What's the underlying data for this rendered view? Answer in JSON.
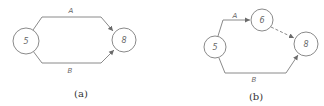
{
  "diagrams": [
    {
      "caption": "(a)",
      "nodes": [
        {
          "id": "5",
          "label": "5"
        },
        {
          "id": "8",
          "label": "8"
        }
      ],
      "edges": [
        {
          "from": "5",
          "to": "8",
          "label": "A",
          "style": "solid"
        },
        {
          "from": "5",
          "to": "8",
          "label": "B",
          "style": "solid"
        }
      ]
    },
    {
      "caption": "(b)",
      "nodes": [
        {
          "id": "5",
          "label": "5"
        },
        {
          "id": "6",
          "label": "6"
        },
        {
          "id": "8",
          "label": "8"
        }
      ],
      "edges": [
        {
          "from": "5",
          "to": "6",
          "label": "A",
          "style": "solid"
        },
        {
          "from": "6",
          "to": "8",
          "label": "",
          "style": "dashed"
        },
        {
          "from": "5",
          "to": "8",
          "label": "B",
          "style": "solid"
        }
      ]
    }
  ],
  "colors": {
    "line": "#8a8a8a",
    "text": "#666666",
    "caption": "#333333"
  }
}
